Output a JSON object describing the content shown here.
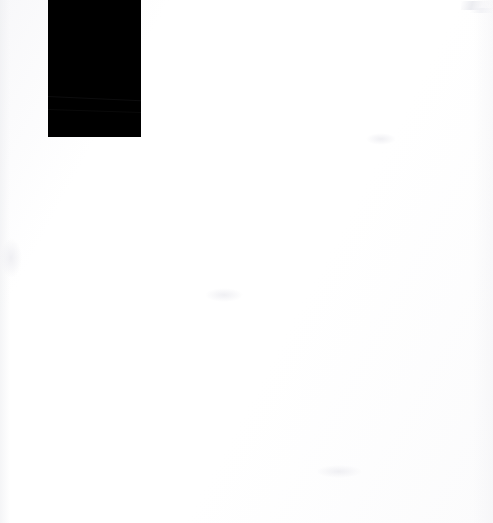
{
  "page": {
    "width_px": 493,
    "height_px": 523,
    "background_color": "#fdfdfd",
    "has_text": false,
    "visible_text": ""
  },
  "shapes": {
    "black_block": {
      "name": "black-block",
      "shape": "rectangle",
      "fill_color": "#000000",
      "x": 48,
      "y": 0,
      "width": 93,
      "height": 137,
      "corner_style": "square",
      "border": "none",
      "label": ""
    }
  },
  "artifacts": {
    "top_right_streak": {
      "name": "scan-artifact",
      "color": "#eceef2",
      "x": 461,
      "y": 1,
      "width": 32,
      "height": 9
    },
    "top_right_streak_2": {
      "name": "scan-artifact",
      "color": "#f0f1f4",
      "x": 470,
      "y": 8,
      "width": 23,
      "height": 5
    },
    "creases": [
      {
        "name": "crease",
        "y": 96,
        "angle_deg": 2.6,
        "opacity": 0.5
      },
      {
        "name": "crease",
        "y": 109,
        "angle_deg": 1.9,
        "opacity": 0.38
      }
    ],
    "smudges": [
      {
        "x": 205,
        "y": 288,
        "w": 38,
        "h": 14
      },
      {
        "x": 366,
        "y": 133,
        "w": 30,
        "h": 12
      },
      {
        "x": 316,
        "y": 465,
        "w": 46,
        "h": 13
      },
      {
        "x": 0,
        "y": 238,
        "w": 22,
        "h": 40
      }
    ]
  }
}
